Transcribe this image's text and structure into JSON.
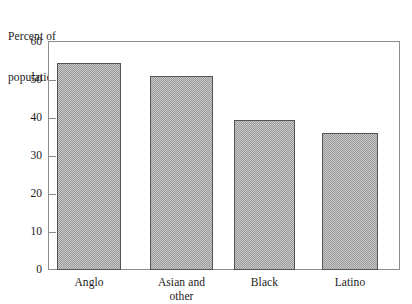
{
  "chart_data": {
    "type": "bar",
    "title": "",
    "subtitle": "",
    "xlabel": "",
    "ylabel": "Percent of population",
    "ylabel_lines": [
      "Percent of",
      "population"
    ],
    "categories": [
      "Anglo",
      "Asian and other",
      "Black",
      "Latino"
    ],
    "category_lines": [
      [
        "Anglo"
      ],
      [
        "Asian and",
        "other"
      ],
      [
        "Black"
      ],
      [
        "Latino"
      ]
    ],
    "values": [
      54.5,
      51,
      39.5,
      36
    ],
    "ylim": [
      0,
      60
    ],
    "ytick_values": [
      0,
      10,
      20,
      30,
      40,
      50,
      60
    ],
    "ytick_labels": [
      "0",
      "10",
      "20",
      "30",
      "40",
      "50",
      "60"
    ],
    "grid": false,
    "legend": false,
    "legend_position": "none",
    "bar_fill": "#b8b8b8",
    "bar_fill_pattern": "checkerboard-halftone",
    "bar_edge_color": "#545454",
    "frame_color": "#8d8d8d",
    "background": "#ffffff",
    "text_color": "#1a1a1a"
  }
}
